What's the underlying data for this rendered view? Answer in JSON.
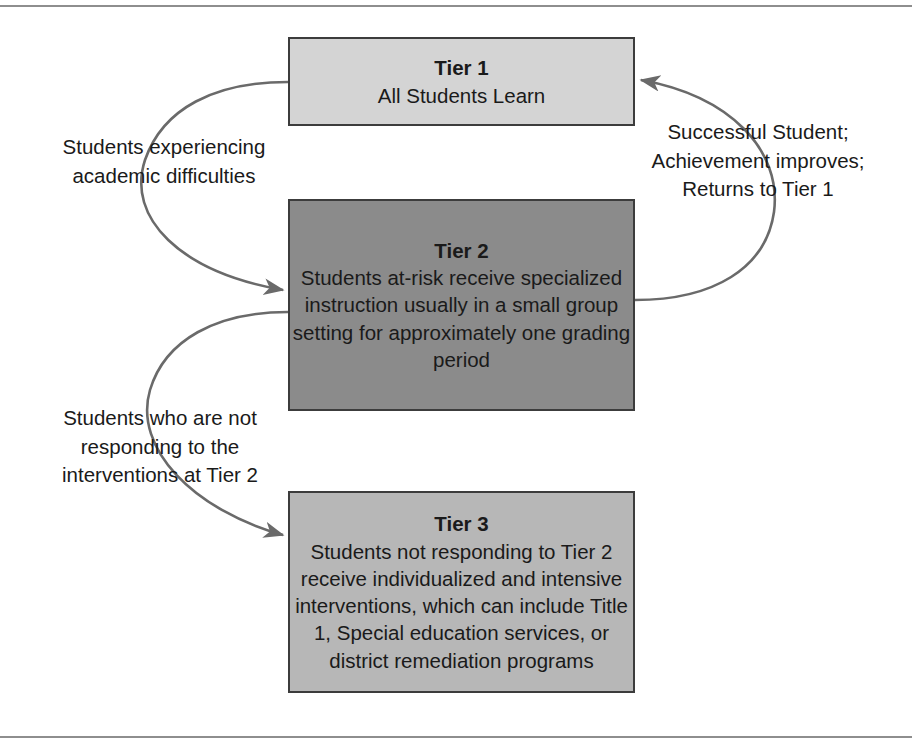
{
  "diagram": {
    "type": "flow-cycle",
    "title_text": "Response to Intervention tier model",
    "colors": {
      "tier1_fill": "#d4d4d4",
      "tier2_fill": "#8b8b8b",
      "tier3_fill": "#b7b7b7",
      "box_border": "#3c3c3c",
      "arrow": "#6a6a6a",
      "rule": "#8e8e8e",
      "text": "#1a1a1a"
    },
    "boxes": [
      {
        "id": "tier1",
        "title": "Tier 1",
        "body": "All Students Learn"
      },
      {
        "id": "tier2",
        "title": "Tier 2",
        "body": "Students at-risk receive\nspecialized instruction usually\nin a small group setting for\napproximately one\ngrading period"
      },
      {
        "id": "tier3",
        "title": "Tier 3",
        "body": "Students not responding\nto Tier 2 receive individualized\nand intensive interventions,\nwhich can include Title 1,\nSpecial education services, or\ndistrict remediation programs"
      }
    ],
    "captions": [
      {
        "id": "tier1-to-tier2",
        "text": "Students experiencing\nacademic difficulties"
      },
      {
        "id": "tier2-to-tier3",
        "text": "Students who are not\nresponding to the\ninterventions at Tier 2"
      },
      {
        "id": "tier2-to-tier1",
        "text": "Successful Student;\nAchievement improves;\nReturns to Tier 1"
      }
    ],
    "arrows": [
      {
        "id": "arrow-tier1-to-tier2",
        "from": "tier1",
        "to": "tier2",
        "side": "left"
      },
      {
        "id": "arrow-tier2-to-tier3",
        "from": "tier2",
        "to": "tier3",
        "side": "left"
      },
      {
        "id": "arrow-tier2-to-tier1",
        "from": "tier2",
        "to": "tier1",
        "side": "right"
      }
    ]
  }
}
